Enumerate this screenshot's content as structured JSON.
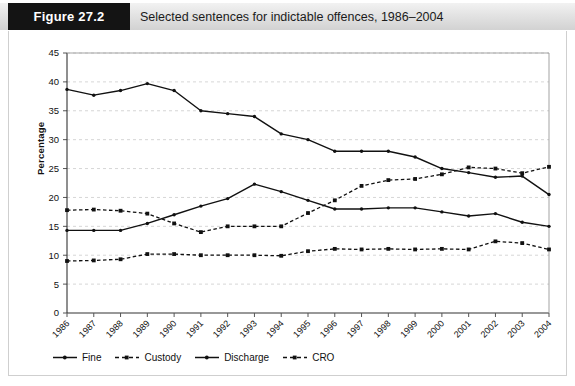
{
  "figure": {
    "tag": "Figure 27.2",
    "title": "Selected sentences for indictable offences, 1986–2004"
  },
  "colors": {
    "tag_bg": "#141414",
    "band_bg": "#e3e3e3",
    "series": "#111111",
    "grid": "#cccccc",
    "axis": "#555555"
  },
  "legend": [
    {
      "label": "Fine",
      "style": "solid",
      "marker": "dot"
    },
    {
      "label": "Custody",
      "style": "dashed",
      "marker": "square"
    },
    {
      "label": "Discharge",
      "style": "solid",
      "marker": "dot"
    },
    {
      "label": "CRO",
      "style": "dashed",
      "marker": "square"
    }
  ],
  "chart_data": {
    "type": "line",
    "title": "Selected sentences for indictable offences, 1986–2004",
    "xlabel": "",
    "ylabel": "Percentage",
    "ylim": [
      0,
      45
    ],
    "ytick_step": 5,
    "yticks": [
      0,
      5,
      10,
      15,
      20,
      25,
      30,
      35,
      40,
      45
    ],
    "grid": true,
    "legend_position": "bottom",
    "categories": [
      "1986",
      "1987",
      "1988",
      "1989",
      "1990",
      "1991",
      "1992",
      "1993",
      "1994",
      "1995",
      "1996",
      "1997",
      "1998",
      "1999",
      "2000",
      "2001",
      "2002",
      "2003",
      "2004"
    ],
    "series": [
      {
        "name": "Fine",
        "style": "solid",
        "values": [
          38.7,
          37.7,
          38.5,
          39.7,
          38.5,
          35.0,
          34.5,
          34.0,
          31.0,
          30.0,
          28.0,
          28.0,
          28.0,
          27.0,
          25.0,
          24.3,
          23.5,
          23.7,
          20.5
        ]
      },
      {
        "name": "Custody",
        "style": "dashed",
        "values": [
          17.8,
          17.9,
          17.7,
          17.2,
          15.5,
          14.0,
          15.0,
          15.0,
          15.0,
          17.3,
          19.5,
          22.0,
          23.0,
          23.2,
          24.0,
          25.2,
          25.0,
          24.2,
          25.3
        ]
      },
      {
        "name": "Discharge",
        "style": "solid",
        "values": [
          14.3,
          14.3,
          14.3,
          15.5,
          17.0,
          18.5,
          19.8,
          22.3,
          21.0,
          19.5,
          18.0,
          18.0,
          18.2,
          18.2,
          17.5,
          16.8,
          17.2,
          15.7,
          15.0
        ]
      },
      {
        "name": "CRO",
        "style": "dashed",
        "values": [
          9.0,
          9.1,
          9.3,
          10.2,
          10.2,
          10.0,
          10.0,
          10.0,
          9.9,
          10.7,
          11.1,
          11.0,
          11.1,
          11.0,
          11.1,
          11.0,
          12.4,
          12.1,
          11.0
        ]
      }
    ]
  }
}
